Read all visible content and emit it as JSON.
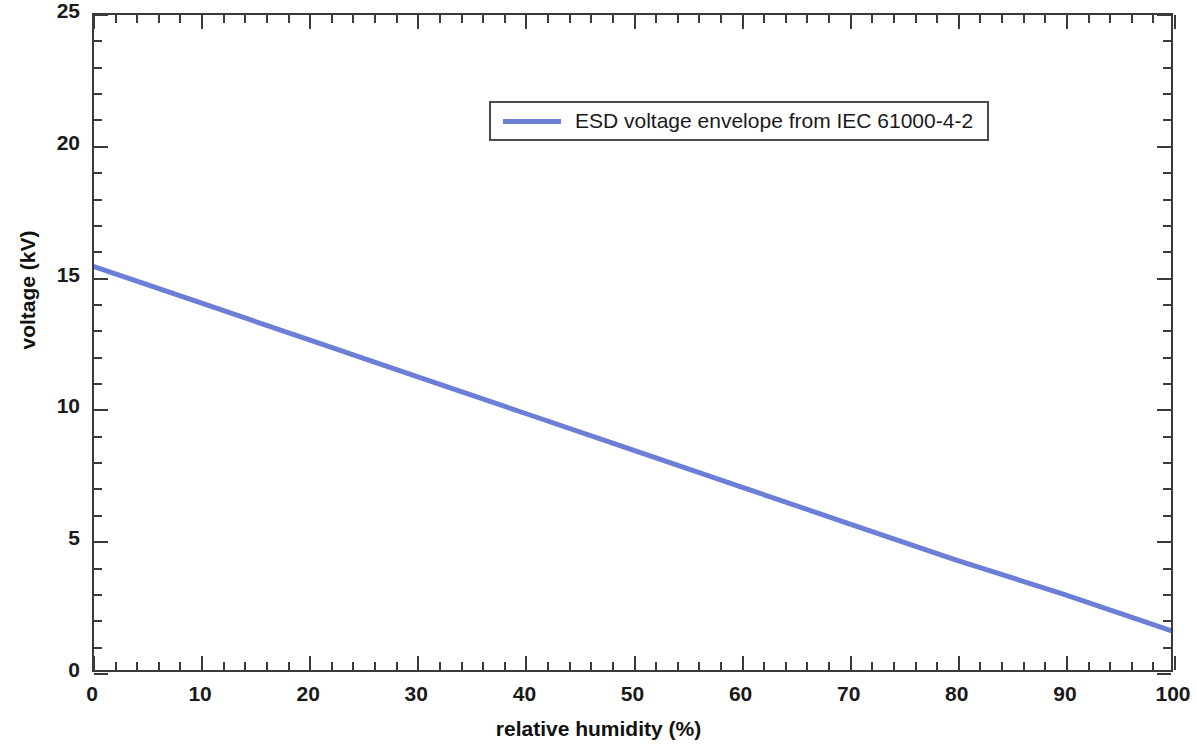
{
  "chart_data": {
    "type": "line",
    "title": "",
    "xlabel": "relative humidity (%)",
    "ylabel": "voltage (kV)",
    "xlim": [
      0,
      100
    ],
    "ylim": [
      0,
      25
    ],
    "xticks": [
      0,
      10,
      20,
      30,
      40,
      50,
      60,
      70,
      80,
      90,
      100
    ],
    "xtick_labels": [
      "0",
      "10",
      "20",
      "30",
      "40",
      "50",
      "60",
      "70",
      "80",
      "90",
      "100"
    ],
    "yticks": [
      0,
      5,
      10,
      15,
      20,
      25
    ],
    "ytick_labels": [
      "0",
      "5",
      "10",
      "15",
      "20",
      "25"
    ],
    "x_minor_interval": 2,
    "y_minor_interval": 1,
    "grid": false,
    "legend_position": "upper center",
    "series": [
      {
        "name": "ESD voltage envelope from IEC 61000-4-2",
        "color": "#6B7FD7",
        "linewidth": 5,
        "x": [
          0,
          10,
          20,
          30,
          40,
          50,
          60,
          70,
          80,
          90,
          100
        ],
        "values": [
          15.4,
          14.0,
          12.6,
          11.2,
          9.8,
          8.4,
          7.0,
          5.6,
          4.2,
          2.9,
          1.5
        ]
      }
    ],
    "annotations": []
  },
  "legend": {
    "entry_label": "ESD voltage envelope from IEC 61000-4-2",
    "swatch_color": "#6B7FD7"
  },
  "axes": {
    "x_title": "relative humidity (%)",
    "y_title": "voltage (kV)"
  }
}
